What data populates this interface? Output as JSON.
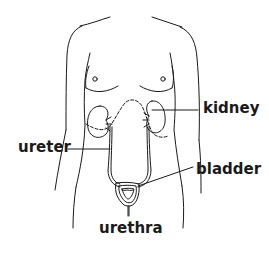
{
  "diagram": {
    "colors": {
      "line": "#1a1a1a",
      "background": "#ffffff"
    },
    "labels": {
      "kidney": "kidney",
      "ureter": "ureter",
      "bladder": "bladder",
      "urethra": "urethra"
    }
  }
}
